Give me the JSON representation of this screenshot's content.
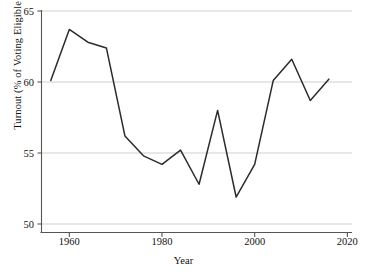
{
  "chart_data": {
    "type": "line",
    "title": "",
    "subtitle": "",
    "xlabel": "Year",
    "ylabel": "Turnout (% of Voting Eligible Population)",
    "xlim": [
      1954,
      2021
    ],
    "ylim": [
      49.2,
      65
    ],
    "xticks": [
      1960,
      1980,
      2000,
      2020
    ],
    "yticks": [
      50,
      55,
      60,
      65
    ],
    "grid": "horizontal",
    "legend": "none",
    "line_color": "#2b2b2b",
    "grid_color": "#c9c9c9",
    "axis_color": "#555555",
    "x": [
      1956,
      1960,
      1964,
      1968,
      1972,
      1976,
      1980,
      1984,
      1988,
      1992,
      1996,
      2000,
      2004,
      2008,
      2012,
      2016
    ],
    "values": [
      60.1,
      63.7,
      62.8,
      62.4,
      56.2,
      54.8,
      54.2,
      55.2,
      52.8,
      58.0,
      51.9,
      54.2,
      60.1,
      61.6,
      58.7,
      60.2
    ],
    "series": [
      {
        "name": "Turnout",
        "values": [
          60.1,
          63.7,
          62.8,
          62.4,
          56.2,
          54.8,
          54.2,
          55.2,
          52.8,
          58.0,
          51.9,
          54.2,
          60.1,
          61.6,
          58.7,
          60.2
        ]
      }
    ],
    "annotations": []
  },
  "axis": {
    "x_tick_labels": [
      "1960",
      "1980",
      "2000",
      "2020"
    ],
    "y_tick_labels": [
      "50",
      "55",
      "60",
      "65"
    ],
    "x_title": "Year",
    "y_title": "Turnout (% of Voting Eligible Population)"
  }
}
